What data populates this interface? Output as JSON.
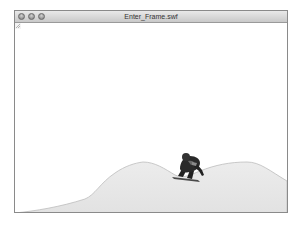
{
  "window": {
    "title": "Enter_Frame.swf",
    "buttons": [
      "close",
      "minimize",
      "zoom"
    ]
  },
  "stage": {
    "background": "#ffffff",
    "terrain": {
      "fill": "#e8e8e8",
      "stroke": "#bdbdbd"
    },
    "character": {
      "description": "snowboarder crouching on board",
      "icon": "snowboarder-icon"
    }
  },
  "colors": {
    "titlebar_top": "#e9e9e9",
    "titlebar_bottom": "#c9c9c9",
    "border": "#8a8a8a"
  }
}
